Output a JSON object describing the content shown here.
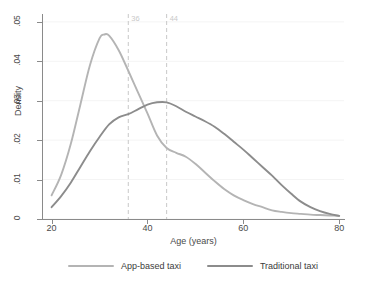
{
  "chart_data": {
    "type": "line",
    "title": "",
    "subtitle": "",
    "xlabel": "Age (years)",
    "ylabel": "Density",
    "xlim": [
      18,
      81
    ],
    "ylim": [
      0,
      0.052
    ],
    "grid": true,
    "grid_orientation": "horizontal",
    "legend_position": "bottom",
    "xticks": [
      20,
      40,
      60,
      80
    ],
    "xtick_labels": [
      "20",
      "40",
      "60",
      "80"
    ],
    "yticks": [
      0,
      0.01,
      0.02,
      0.03,
      0.04,
      0.05
    ],
    "ytick_labels": [
      "0",
      ".01",
      ".02",
      ".03",
      ".04",
      ".05"
    ],
    "annotations": [
      {
        "type": "vline",
        "x": 36,
        "label": "36",
        "style": "dashed",
        "color": "#c9c9c9"
      },
      {
        "type": "vline",
        "x": 44,
        "label": "44",
        "style": "dashed",
        "color": "#c9c9c9"
      }
    ],
    "series": [
      {
        "name": "App-based taxi",
        "color": "#b4b4b4",
        "x": [
          20,
          22,
          24,
          26,
          28,
          30,
          31,
          32,
          34,
          36,
          38,
          40,
          42,
          44,
          46,
          48,
          50,
          52,
          54,
          56,
          58,
          60,
          62,
          64,
          66,
          68,
          70,
          72,
          74,
          76,
          78,
          80
        ],
        "values": [
          0.006,
          0.0112,
          0.019,
          0.029,
          0.039,
          0.0458,
          0.0468,
          0.0465,
          0.0428,
          0.0376,
          0.0322,
          0.0268,
          0.0212,
          0.018,
          0.0168,
          0.0158,
          0.014,
          0.0118,
          0.0096,
          0.0076,
          0.006,
          0.0048,
          0.0038,
          0.003,
          0.0022,
          0.0018,
          0.0015,
          0.0013,
          0.0011,
          0.001,
          0.0009,
          0.0008
        ]
      },
      {
        "name": "Traditional taxi",
        "color": "#8c8c8c",
        "x": [
          20,
          22,
          24,
          26,
          28,
          30,
          32,
          34,
          36,
          38,
          40,
          42,
          44,
          46,
          48,
          50,
          52,
          54,
          56,
          58,
          60,
          62,
          64,
          66,
          68,
          70,
          72,
          74,
          76,
          78,
          80
        ],
        "values": [
          0.003,
          0.0058,
          0.0092,
          0.0132,
          0.0172,
          0.0208,
          0.024,
          0.0258,
          0.0266,
          0.0278,
          0.029,
          0.0296,
          0.0296,
          0.0286,
          0.0272,
          0.026,
          0.0248,
          0.0234,
          0.0216,
          0.0196,
          0.0176,
          0.0154,
          0.0132,
          0.011,
          0.0086,
          0.0064,
          0.0044,
          0.003,
          0.002,
          0.0013,
          0.0008
        ]
      }
    ]
  },
  "legend": {
    "items": [
      {
        "label": "App-based taxi",
        "color": "#b4b4b4"
      },
      {
        "label": "Traditional taxi",
        "color": "#8c8c8c"
      }
    ]
  },
  "axes": {
    "x_title": "Age (years)",
    "y_title": "Density"
  }
}
